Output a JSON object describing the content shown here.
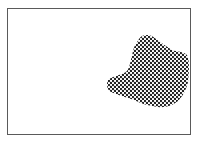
{
  "figure": {
    "frame_color": "#5a5a5a",
    "pattern": {
      "name": "checkerboard-halftone",
      "ink_color": "#1a1a1a",
      "paper_color": "#ffffff"
    }
  }
}
